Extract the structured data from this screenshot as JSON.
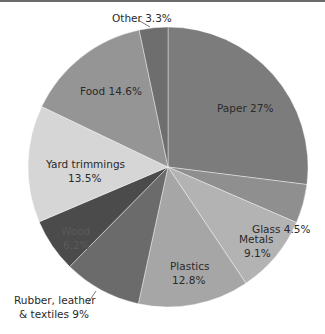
{
  "chart_data": {
    "type": "pie",
    "title": "",
    "start_angle_deg": 0,
    "direction": "clockwise",
    "center": [
      168,
      167
    ],
    "radius": 140,
    "slices": [
      {
        "label": "Paper",
        "value": 27.0,
        "display": "Paper 27%",
        "color": "#7c7c7c"
      },
      {
        "label": "Glass",
        "value": 4.5,
        "display": "Glass 4.5%",
        "color": "#8f8f8f"
      },
      {
        "label": "Metals",
        "value": 9.1,
        "display": "Metals\n9.1%",
        "color": "#b3b3b3"
      },
      {
        "label": "Plastics",
        "value": 12.8,
        "display": "Plastics\n12.8%",
        "color": "#a6a6a6"
      },
      {
        "label": "Rubber, leather & textiles",
        "value": 9.0,
        "display": "Rubber, leather\n& textiles 9%",
        "color": "#6b6b6b"
      },
      {
        "label": "Wood",
        "value": 6.2,
        "display": "Wood\n6.2%",
        "color": "#4b4b4b"
      },
      {
        "label": "Yard trimmings",
        "value": 13.5,
        "display": "Yard trimmings\n13.5%",
        "color": "#d6d6d6"
      },
      {
        "label": "Food",
        "value": 14.6,
        "display": "Food 14.6%",
        "color": "#959595"
      },
      {
        "label": "Other",
        "value": 3.3,
        "display": "Other 3.3%",
        "color": "#6e6e6e"
      }
    ],
    "legend": "none (direct labels)"
  }
}
